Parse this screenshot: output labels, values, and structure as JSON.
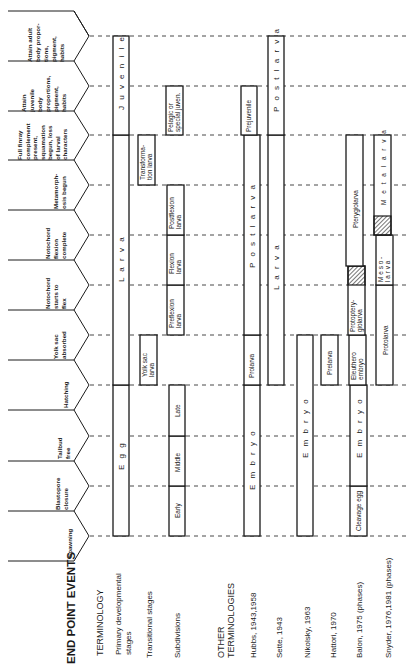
{
  "diagram": {
    "header": "END POINT EVENTS",
    "section_terminology": "TERMINOLOGY",
    "section_other": [
      "OTHER",
      "TERMINOLOGIES"
    ],
    "rows": [
      {
        "id": "primary",
        "label": [
          "Primary developmental",
          "stages"
        ]
      },
      {
        "id": "transitional",
        "label": [
          "Transitional stages"
        ]
      },
      {
        "id": "subdivisions",
        "label": [
          "Subdivisions"
        ]
      },
      {
        "id": "hubbs",
        "label": [
          "Hubbs, 1943,1958"
        ]
      },
      {
        "id": "sette",
        "label": [
          "Sette, 1943"
        ]
      },
      {
        "id": "nikolsky",
        "label": [
          "Nikolsky, 1963"
        ]
      },
      {
        "id": "hattori",
        "label": [
          "Hattori, 1970"
        ]
      },
      {
        "id": "balon",
        "label": [
          "Balon, 1975 (phases)"
        ]
      },
      {
        "id": "snyder",
        "label": [
          "Snyder, 1976,1981 (phases)"
        ]
      }
    ],
    "end_point_events": [
      {
        "id": "spawning",
        "label": [
          "Spawning"
        ]
      },
      {
        "id": "blastopore",
        "label": [
          "Blastopore",
          "closure"
        ]
      },
      {
        "id": "tailbud",
        "label": [
          "Tailbud",
          "free"
        ]
      },
      {
        "id": "hatching",
        "label": [
          "Hatching"
        ]
      },
      {
        "id": "yolk",
        "label": [
          "Yolk sac",
          "absorbed"
        ]
      },
      {
        "id": "notochord_start",
        "label": [
          "Notochord",
          "starts to",
          "flex"
        ]
      },
      {
        "id": "notochord_complete",
        "label": [
          "Notochord",
          "flexion",
          "complete"
        ]
      },
      {
        "id": "metamorphosis",
        "label": [
          "Metamorph-",
          "osis begun"
        ]
      },
      {
        "id": "finray",
        "label": [
          "Full finray",
          "complement",
          "present,",
          "squamation",
          "begun, loss",
          "of larval",
          "characters"
        ]
      },
      {
        "id": "juvenile_props",
        "label": [
          "Attain",
          "juvenile",
          "body",
          "proportions,",
          "pigment,",
          "habits"
        ]
      },
      {
        "id": "adult_props",
        "label": [
          "Attain adult",
          "body propor-",
          "tions,",
          "pigment,",
          "habits"
        ]
      }
    ],
    "stages": {
      "primary": {
        "egg": "E g g",
        "larva": "L a r v a",
        "juvenile": "J u v e n i l e"
      },
      "transitional": {
        "yolk_sac": [
          "Yolk sac",
          "larva"
        ],
        "transformation": [
          "Transforma-",
          "tion larva"
        ],
        "pelagic": [
          "Pelagic or",
          "special juven."
        ]
      },
      "subdivisions": {
        "early": "Early",
        "middle": "Middle",
        "late": "Late",
        "preflexion": [
          "Preflexion",
          "larva"
        ],
        "flexion": [
          "Flexion",
          "larva"
        ],
        "postflexion": [
          "Postflexion",
          "larva"
        ]
      },
      "hubbs": {
        "embryo": "E m b r y o",
        "prolarva": "Prolarva",
        "postlarva": "P o s t l a r v a",
        "prejuvenile": "Prejuvenile"
      },
      "sette": {
        "larva": "L a r v a",
        "postlarva": "P o s t l a r v a"
      },
      "nikolsky": {
        "embryo": "E m b r y o"
      },
      "hattori": {
        "prelarva": "Prelarva"
      },
      "balon": {
        "cleavage": "Cleavage egg",
        "embryo": "E m b r y o",
        "eleuthero": [
          "Eleuthero",
          "embryo"
        ],
        "protoptery": [
          "Protoptery-",
          "giolarva"
        ],
        "pterygio": "Pterygiolarva"
      },
      "snyder": {
        "protolarva": "Protolarva",
        "mesolarva": [
          "M e s o -",
          "l a r v a"
        ],
        "metalarva": "M e t a l a r v a"
      }
    }
  }
}
